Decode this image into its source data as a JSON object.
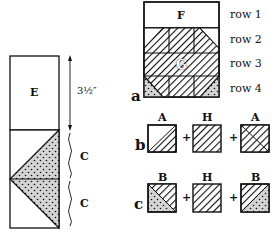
{
  "left_strip": {
    "block_e_label": "E",
    "measure_label": "3½″",
    "block_c_top_label": "C",
    "block_c_bottom_label": "C"
  },
  "assembly": {
    "block_f_label": "F",
    "block_g_label": "G",
    "rows": [
      {
        "label": "row 1"
      },
      {
        "label": "row 2"
      },
      {
        "label": "row 3"
      },
      {
        "label": "row 4"
      }
    ],
    "step_a_label": "a"
  },
  "step_b": {
    "label": "b",
    "pieces": [
      "A",
      "H",
      "A"
    ],
    "plus": "+"
  },
  "step_c": {
    "label": "c",
    "pieces": [
      "B",
      "H",
      "B"
    ],
    "plus": "+"
  },
  "colors": {
    "line": "#111111",
    "dot_fill": "#d4d4d4",
    "background": "#ffffff"
  }
}
